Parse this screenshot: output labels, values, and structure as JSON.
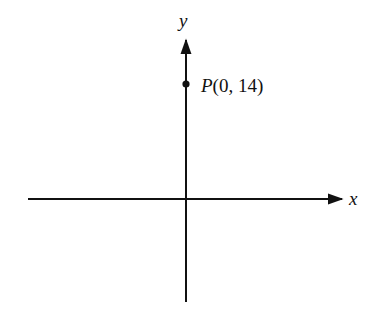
{
  "diagram": {
    "type": "coordinate-plane",
    "axes": {
      "x_label": "x",
      "y_label": "y"
    },
    "point": {
      "name": "P",
      "coords": [
        0,
        14
      ],
      "label_prefix": "P",
      "label_suffix": "(0, 14)"
    }
  }
}
